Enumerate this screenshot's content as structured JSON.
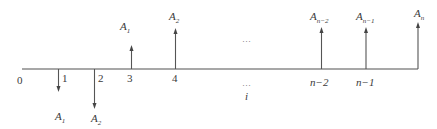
{
  "diagram": {
    "type": "cash-flow timeline",
    "axis_color": "#8a8a8a",
    "ticks": [
      {
        "label": "0"
      },
      {
        "label": "1"
      },
      {
        "label": "2"
      },
      {
        "label": "3"
      },
      {
        "label": "4"
      },
      {
        "label": "…"
      },
      {
        "label": "i"
      },
      {
        "label": "n−2"
      },
      {
        "label": "n−1"
      }
    ],
    "outflows": [
      {
        "period": "1",
        "base": "A",
        "sub": "1"
      },
      {
        "period": "2",
        "base": "A",
        "sub": "2"
      }
    ],
    "inflows": [
      {
        "period": "3",
        "base": "A",
        "sub": "1"
      },
      {
        "period": "4",
        "base": "A",
        "sub": "2"
      },
      {
        "period": "n−2",
        "base": "A",
        "sub": "n−2"
      },
      {
        "period": "n−1",
        "base": "A",
        "sub": "n−1"
      },
      {
        "period": "n",
        "base": "A",
        "sub": "n"
      }
    ],
    "ellipsis_top": "…",
    "ellipsis_bottom": "…"
  }
}
